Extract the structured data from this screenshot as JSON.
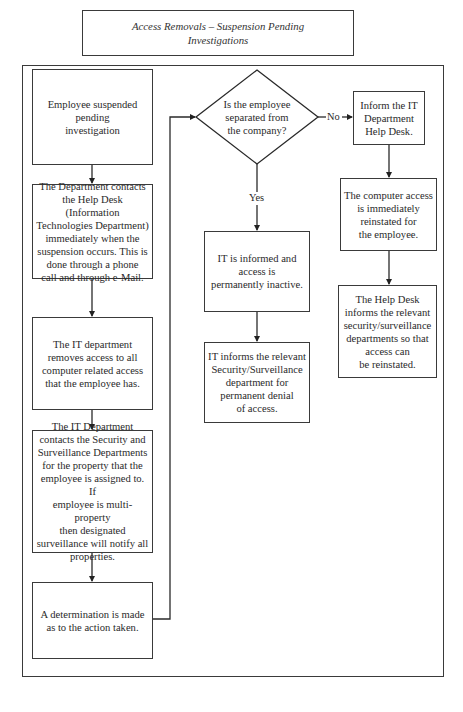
{
  "title": "Access Removals – Suspension Pending\nInvestigations",
  "nodes": {
    "start": "Employee suspended\npending\ninvestigation",
    "contact_help_desk": "The Department contacts\nthe Help Desk (Information\nTechnologies Department)\nimmediately when the\nsuspension occurs. This is\ndone through a phone\ncall and through e-Mail.",
    "remove_access": "The IT department\nremoves access to all\ncomputer related access\nthat the employee has.",
    "contact_security": "The IT Department\ncontacts the Security and\nSurveillance Departments\nfor the property that the\nemployee is assigned to. If\nemployee is multi-property\nthen designated\nsurveillance will notify all\nproperties.",
    "determination": "A determination is made\nas to the action taken.",
    "decision": "Is the employee\nseparated from\nthe company?",
    "inform_it": "Inform the IT\nDepartment\nHelp Desk.",
    "reinstate": "The computer access\nis immediately\nreinstated for\nthe employee.",
    "help_desk_informs": "The Help Desk\ninforms the relevant\nsecurity/surveillance\ndepartments so that\naccess can\nbe reinstated.",
    "permanently_inactive": "IT is informed and\naccess is\npermanently inactive.",
    "permanent_denial": "IT informs the relevant\nSecurity/Surveillance\ndepartment for\npermanent denial\nof access."
  },
  "edge_labels": {
    "yes": "Yes",
    "no": "No"
  }
}
